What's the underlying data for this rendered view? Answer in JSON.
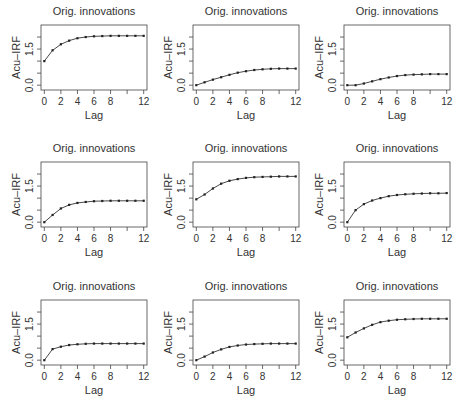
{
  "chart_data": [
    {
      "type": "line",
      "panel": 1,
      "title": "Orig. innovations",
      "xlabel": "Lag",
      "ylabel": "Acu–IRF",
      "x": [
        0,
        1,
        2,
        3,
        4,
        5,
        6,
        7,
        8,
        9,
        10,
        11,
        12
      ],
      "values": [
        1.0,
        1.45,
        1.7,
        1.85,
        1.95,
        2.0,
        2.03,
        2.04,
        2.05,
        2.05,
        2.05,
        2.05,
        2.05
      ],
      "xticks": [
        0,
        2,
        4,
        6,
        8,
        10,
        12
      ],
      "xticklabels": [
        "0",
        "2",
        "4",
        "6",
        "8",
        "",
        "12"
      ],
      "yticks": [
        0.0,
        0.5,
        1.0,
        1.5,
        2.0
      ],
      "yticklabels": [
        "0.0",
        "",
        "",
        "1.5",
        ""
      ],
      "xlim": [
        -0.4,
        12.4
      ],
      "ylim": [
        -0.2,
        2.5
      ],
      "grid": false,
      "legend": null
    },
    {
      "type": "line",
      "panel": 2,
      "title": "Orig. innovations",
      "xlabel": "Lag",
      "ylabel": "Acu–IRF",
      "x": [
        0,
        1,
        2,
        3,
        4,
        5,
        6,
        7,
        8,
        9,
        10,
        11,
        12
      ],
      "values": [
        0.0,
        0.12,
        0.23,
        0.33,
        0.43,
        0.52,
        0.58,
        0.63,
        0.66,
        0.68,
        0.69,
        0.69,
        0.69
      ],
      "xticks": [
        0,
        2,
        4,
        6,
        8,
        10,
        12
      ],
      "xticklabels": [
        "0",
        "2",
        "4",
        "6",
        "8",
        "",
        "12"
      ],
      "yticks": [
        0.0,
        0.5,
        1.0,
        1.5,
        2.0
      ],
      "yticklabels": [
        "0.0",
        "",
        "",
        "1.5",
        ""
      ],
      "xlim": [
        -0.4,
        12.4
      ],
      "ylim": [
        -0.2,
        2.5
      ],
      "grid": false,
      "legend": null
    },
    {
      "type": "line",
      "panel": 3,
      "title": "Orig. innovations",
      "xlabel": "Lag",
      "ylabel": "Acu–IRF",
      "x": [
        0,
        1,
        2,
        3,
        4,
        5,
        6,
        7,
        8,
        9,
        10,
        11,
        12
      ],
      "values": [
        0.0,
        0.0,
        0.07,
        0.16,
        0.25,
        0.32,
        0.38,
        0.42,
        0.44,
        0.45,
        0.46,
        0.46,
        0.46
      ],
      "xticks": [
        0,
        2,
        4,
        6,
        8,
        10,
        12
      ],
      "xticklabels": [
        "0",
        "2",
        "4",
        "6",
        "8",
        "",
        "12"
      ],
      "yticks": [
        0.0,
        0.5,
        1.0,
        1.5,
        2.0
      ],
      "yticklabels": [
        "0.0",
        "",
        "",
        "1.5",
        ""
      ],
      "xlim": [
        -0.4,
        12.4
      ],
      "ylim": [
        -0.2,
        2.5
      ],
      "grid": false,
      "legend": null
    },
    {
      "type": "line",
      "panel": 4,
      "title": "Orig. innovations",
      "xlabel": "Lag",
      "ylabel": "Acu–IRF",
      "x": [
        0,
        1,
        2,
        3,
        4,
        5,
        6,
        7,
        8,
        9,
        10,
        11,
        12
      ],
      "values": [
        0.0,
        0.3,
        0.57,
        0.72,
        0.8,
        0.84,
        0.87,
        0.88,
        0.89,
        0.89,
        0.89,
        0.89,
        0.89
      ],
      "xticks": [
        0,
        2,
        4,
        6,
        8,
        10,
        12
      ],
      "xticklabels": [
        "0",
        "2",
        "4",
        "6",
        "8",
        "",
        "12"
      ],
      "yticks": [
        0.0,
        0.5,
        1.0,
        1.5,
        2.0
      ],
      "yticklabels": [
        "0.0",
        "",
        "",
        "1.5",
        ""
      ],
      "xlim": [
        -0.4,
        12.4
      ],
      "ylim": [
        -0.2,
        2.5
      ],
      "grid": false,
      "legend": null
    },
    {
      "type": "line",
      "panel": 5,
      "title": "Orig. innovations",
      "xlabel": "Lag",
      "ylabel": "Acu–IRF",
      "x": [
        0,
        1,
        2,
        3,
        4,
        5,
        6,
        7,
        8,
        9,
        10,
        11,
        12
      ],
      "values": [
        0.95,
        1.15,
        1.4,
        1.6,
        1.72,
        1.79,
        1.84,
        1.87,
        1.88,
        1.89,
        1.9,
        1.9,
        1.9
      ],
      "xticks": [
        0,
        2,
        4,
        6,
        8,
        10,
        12
      ],
      "xticklabels": [
        "0",
        "2",
        "4",
        "6",
        "8",
        "",
        "12"
      ],
      "yticks": [
        0.0,
        0.5,
        1.0,
        1.5,
        2.0
      ],
      "yticklabels": [
        "0.0",
        "",
        "",
        "1.5",
        ""
      ],
      "xlim": [
        -0.4,
        12.4
      ],
      "ylim": [
        -0.2,
        2.5
      ],
      "grid": false,
      "legend": null
    },
    {
      "type": "line",
      "panel": 6,
      "title": "Orig. innovations",
      "xlabel": "Lag",
      "ylabel": "Acu–IRF",
      "x": [
        0,
        1,
        2,
        3,
        4,
        5,
        6,
        7,
        8,
        9,
        10,
        11,
        12
      ],
      "values": [
        0.0,
        0.5,
        0.75,
        0.9,
        1.0,
        1.08,
        1.13,
        1.16,
        1.18,
        1.19,
        1.2,
        1.2,
        1.21
      ],
      "xticks": [
        0,
        2,
        4,
        6,
        8,
        10,
        12
      ],
      "xticklabels": [
        "0",
        "2",
        "4",
        "6",
        "8",
        "",
        "12"
      ],
      "yticks": [
        0.0,
        0.5,
        1.0,
        1.5,
        2.0
      ],
      "yticklabels": [
        "0.0",
        "",
        "",
        "1.5",
        ""
      ],
      "xlim": [
        -0.4,
        12.4
      ],
      "ylim": [
        -0.2,
        2.5
      ],
      "grid": false,
      "legend": null
    },
    {
      "type": "line",
      "panel": 7,
      "title": "Orig. innovations",
      "xlabel": "Lag",
      "ylabel": "Acu–IRF",
      "x": [
        0,
        1,
        2,
        3,
        4,
        5,
        6,
        7,
        8,
        9,
        10,
        11,
        12
      ],
      "values": [
        0.0,
        0.46,
        0.56,
        0.63,
        0.66,
        0.68,
        0.69,
        0.69,
        0.69,
        0.69,
        0.69,
        0.69,
        0.69
      ],
      "xticks": [
        0,
        2,
        4,
        6,
        8,
        10,
        12
      ],
      "xticklabels": [
        "0",
        "2",
        "4",
        "6",
        "8",
        "",
        "12"
      ],
      "yticks": [
        0.0,
        0.5,
        1.0,
        1.5,
        2.0
      ],
      "yticklabels": [
        "0.0",
        "",
        "",
        "1.5",
        ""
      ],
      "xlim": [
        -0.4,
        12.4
      ],
      "ylim": [
        -0.2,
        2.5
      ],
      "grid": false,
      "legend": null
    },
    {
      "type": "line",
      "panel": 8,
      "title": "Orig. innovations",
      "xlabel": "Lag",
      "ylabel": "Acu–IRF",
      "x": [
        0,
        1,
        2,
        3,
        4,
        5,
        6,
        7,
        8,
        9,
        10,
        11,
        12
      ],
      "values": [
        0.0,
        0.15,
        0.32,
        0.45,
        0.55,
        0.61,
        0.65,
        0.67,
        0.68,
        0.69,
        0.69,
        0.69,
        0.69
      ],
      "xticks": [
        0,
        2,
        4,
        6,
        8,
        10,
        12
      ],
      "xticklabels": [
        "0",
        "2",
        "4",
        "6",
        "8",
        "",
        "12"
      ],
      "yticks": [
        0.0,
        0.5,
        1.0,
        1.5,
        2.0
      ],
      "yticklabels": [
        "0.0",
        "",
        "",
        "1.5",
        ""
      ],
      "xlim": [
        -0.4,
        12.4
      ],
      "ylim": [
        -0.2,
        2.5
      ],
      "grid": false,
      "legend": null
    },
    {
      "type": "line",
      "panel": 9,
      "title": "Orig. innovations",
      "xlabel": "Lag",
      "ylabel": "Acu–IRF",
      "x": [
        0,
        1,
        2,
        3,
        4,
        5,
        6,
        7,
        8,
        9,
        10,
        11,
        12
      ],
      "values": [
        0.95,
        1.15,
        1.32,
        1.47,
        1.58,
        1.64,
        1.68,
        1.7,
        1.71,
        1.72,
        1.72,
        1.72,
        1.72
      ],
      "xticks": [
        0,
        2,
        4,
        6,
        8,
        10,
        12
      ],
      "xticklabels": [
        "0",
        "2",
        "4",
        "6",
        "8",
        "",
        "12"
      ],
      "yticks": [
        0.0,
        0.5,
        1.0,
        1.5,
        2.0
      ],
      "yticklabels": [
        "0.0",
        "",
        "",
        "1.5",
        ""
      ],
      "xlim": [
        -0.4,
        12.4
      ],
      "ylim": [
        -0.2,
        2.5
      ],
      "grid": false,
      "legend": null
    }
  ],
  "layout": {
    "rows": 3,
    "cols": 3,
    "panel_origins": [
      [
        0,
        0
      ],
      [
        152,
        0
      ],
      [
        303,
        0
      ],
      [
        0,
        137
      ],
      [
        152,
        137
      ],
      [
        303,
        137
      ],
      [
        0,
        275
      ],
      [
        152,
        275
      ],
      [
        303,
        275
      ]
    ],
    "line_color": "#333333",
    "marker_color": "#222222",
    "axis_color": "#444444"
  }
}
